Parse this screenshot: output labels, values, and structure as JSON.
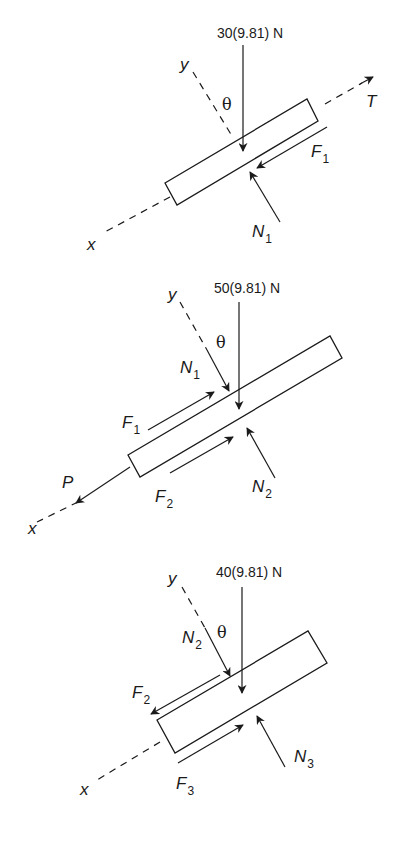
{
  "figure": {
    "diagrams": [
      {
        "id": "block-1",
        "weight_label": "30(9.81) N",
        "axis_x": "x",
        "axis_y": "y",
        "angle": "θ",
        "forces": [
          {
            "name": "T",
            "sub": ""
          },
          {
            "name": "F",
            "sub": "1"
          },
          {
            "name": "N",
            "sub": "1"
          }
        ]
      },
      {
        "id": "block-2",
        "weight_label": "50(9.81) N",
        "axis_x": "x",
        "axis_y": "y",
        "angle": "θ",
        "forces": [
          {
            "name": "N",
            "sub": "1"
          },
          {
            "name": "F",
            "sub": "1"
          },
          {
            "name": "F",
            "sub": "2"
          },
          {
            "name": "N",
            "sub": "2"
          },
          {
            "name": "P",
            "sub": ""
          }
        ]
      },
      {
        "id": "block-3",
        "weight_label": "40(9.81) N",
        "axis_x": "x",
        "axis_y": "y",
        "angle": "θ",
        "forces": [
          {
            "name": "N",
            "sub": "2"
          },
          {
            "name": "F",
            "sub": "2"
          },
          {
            "name": "F",
            "sub": "3"
          },
          {
            "name": "N",
            "sub": "3"
          }
        ]
      }
    ],
    "colors": {
      "ink": "#1a1a1a",
      "background": "#ffffff"
    }
  }
}
